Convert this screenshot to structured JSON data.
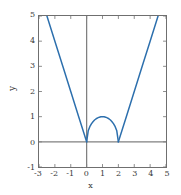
{
  "chart_data": {
    "type": "line",
    "title": "",
    "xlabel": "x",
    "ylabel": "y",
    "xlim": [
      -3,
      5
    ],
    "ylim": [
      -1,
      5
    ],
    "xticks": [
      "-3",
      "-2",
      "-1",
      "0",
      "1",
      "2",
      "3",
      "4",
      "5"
    ],
    "xtick_values": [
      -3,
      -2,
      -1,
      0,
      1,
      2,
      3,
      4,
      5
    ],
    "yticks": [
      "-1",
      "0",
      "1",
      "2",
      "3",
      "4",
      "5"
    ],
    "ytick_values": [
      -1,
      0,
      1,
      2,
      3,
      4,
      5
    ],
    "grid": false,
    "legend": null,
    "legend_position": "none",
    "line_color": "#2c6fad",
    "axis_color": "#808080",
    "frame_color": "#6f6f6f",
    "series": [
      {
        "name": "left-branch",
        "comment": "straight line, slope -2, from y=5 down to (0,0)",
        "x": [
          -2.5,
          -2.0,
          -1.5,
          -1.0,
          -0.5,
          0.0
        ],
        "y": [
          5.0,
          4.0,
          3.0,
          2.0,
          1.0,
          0.0
        ]
      },
      {
        "name": "semicircular-arc",
        "comment": "upper half circle radius 1 centered at (1,0), peak y=1 at x=1",
        "x": [
          0.0,
          0.1,
          0.2,
          0.3,
          0.4,
          0.5,
          0.6,
          0.7,
          0.8,
          0.9,
          1.0,
          1.1,
          1.2,
          1.3,
          1.4,
          1.5,
          1.6,
          1.7,
          1.8,
          1.9,
          2.0
        ],
        "y": [
          0.0,
          0.436,
          0.6,
          0.714,
          0.8,
          0.866,
          0.917,
          0.954,
          0.98,
          0.995,
          1.0,
          0.995,
          0.98,
          0.954,
          0.917,
          0.866,
          0.8,
          0.714,
          0.6,
          0.436,
          0.0
        ]
      },
      {
        "name": "right-branch",
        "comment": "straight line, slope +2, from (2,0) up to y=5",
        "x": [
          2.0,
          2.5,
          3.0,
          3.5,
          4.0,
          4.5
        ],
        "y": [
          0.0,
          1.0,
          2.0,
          3.0,
          4.0,
          5.0
        ]
      }
    ]
  }
}
